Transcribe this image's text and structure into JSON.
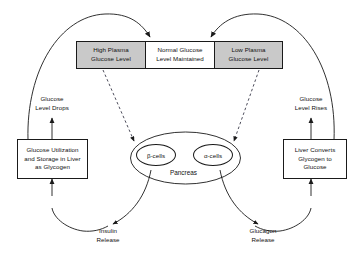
{
  "diagram": {
    "boxes": {
      "high_plasma": "High Plasma\nGlucose Level",
      "normal_glucose": "Normal Glucose\nLevel Maintained",
      "low_plasma": "Low Plasma\nGlucose Level",
      "glucose_utilization": "Glucose Utilization\nand Storage in Liver\nas Glycogen",
      "liver_converts": "Liver Converts\nGlycogen to\nGlucose"
    },
    "organ": {
      "pancreas_label": "Pancreas",
      "beta_cells": "β-cells",
      "alpha_cells": "α-cells"
    },
    "captions": {
      "glucose_level_drops": "Glucose\nLevel Drops",
      "glucose_level_rises": "Glucose\nLevel Rises",
      "insulin_release": "Insulin\nRelease",
      "glucagon_release": "Glucagon\nRelease"
    },
    "colors": {
      "box_fill_gray": "#c9c9c9",
      "box_fill_white": "#ffffff",
      "stroke": "#1a1a1a",
      "text": "#111111",
      "background": "#ffffff"
    }
  }
}
